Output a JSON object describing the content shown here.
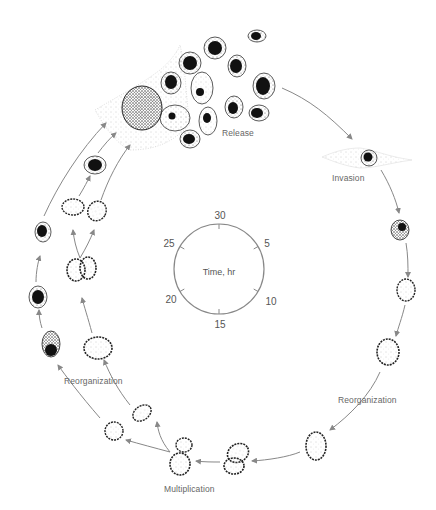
{
  "diagram": {
    "type": "life-cycle",
    "stage_labels": {
      "release": "Release",
      "invasion": "Invasion",
      "reorganization_right": "Reorganization",
      "multiplication": "Multiplication",
      "reorganization_left": "Reorganization"
    },
    "clock": {
      "center_label": "Time, hr",
      "ticks": [
        "30",
        "5",
        "10",
        "15",
        "20",
        "25"
      ]
    },
    "colors": {
      "arrow": "#888888",
      "cell_outline": "#333333",
      "nucleus": "#111111",
      "text": "#666666"
    }
  }
}
